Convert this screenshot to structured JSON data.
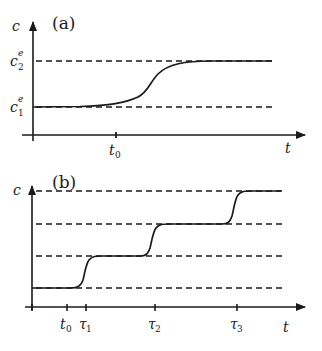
{
  "panel_a": {
    "label": "(a)",
    "y_axis_label": "c",
    "x_axis_label": "t",
    "levels": [
      {
        "name": "c2e",
        "base": "c",
        "sub": "2",
        "sup": "e"
      },
      {
        "name": "c1e",
        "base": "c",
        "sub": "1",
        "sup": "e"
      }
    ],
    "ticks": [
      {
        "base": "t",
        "sub": "0"
      }
    ],
    "description": "Single sigmoidal transition of concentration c from equilibrium level c1e to c2e after time t0"
  },
  "panel_b": {
    "label": "(b)",
    "y_axis_label": "c",
    "x_axis_label": "t",
    "dashed_levels": 4,
    "ticks": [
      {
        "base": "t",
        "sub": "0"
      },
      {
        "base": "τ",
        "sub": "1"
      },
      {
        "base": "τ",
        "sub": "2"
      },
      {
        "base": "τ",
        "sub": "3"
      }
    ],
    "description": "Staircase of three successive sigmoidal transitions between four equilibrium levels at times τ1, τ2, τ3"
  },
  "colors": {
    "line": "#1a1a1a",
    "background": "#ffffff"
  }
}
